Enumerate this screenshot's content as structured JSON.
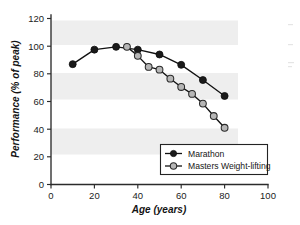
{
  "chart_data": {
    "type": "line",
    "title": "",
    "xlabel": "Age (years)",
    "ylabel": "Performance (% of peak)",
    "xlim": [
      0,
      100
    ],
    "ylim": [
      0,
      120
    ],
    "xticks": [
      0,
      20,
      40,
      60,
      80,
      100
    ],
    "yticks": [
      0,
      20,
      40,
      60,
      80,
      100,
      120
    ],
    "grid": "alternating horizontal gray bands",
    "legend_position": "lower-right inside axes",
    "series": [
      {
        "name": "Marathon",
        "marker": "filled-circle",
        "color": "#1a1a1a",
        "x": [
          10,
          20,
          30,
          40,
          50,
          60,
          70,
          80
        ],
        "values": [
          87,
          97.5,
          99.5,
          97.5,
          94,
          86.5,
          75.5,
          64
        ]
      },
      {
        "name": "Masters Weight-lifting",
        "marker": "open-circle",
        "color": "#b6b6b6",
        "x": [
          35,
          40,
          45,
          50,
          55,
          60,
          65,
          70,
          75,
          80
        ],
        "values": [
          99.5,
          93,
          85,
          83,
          76.5,
          70.5,
          65.5,
          58.5,
          49.5,
          41
        ]
      }
    ]
  },
  "axes": {
    "x_title": "Age (years)",
    "y_title": "Performance (% of peak)",
    "x_tick_labels": [
      "0",
      "20",
      "40",
      "60",
      "80",
      "100"
    ],
    "y_tick_labels": [
      "0",
      "20",
      "40",
      "60",
      "80",
      "100",
      "120"
    ]
  },
  "legend": {
    "entries": [
      {
        "label": "Marathon",
        "marker": "filled-circle"
      },
      {
        "label": "Masters Weight-lifting",
        "marker": "open-circle"
      }
    ]
  },
  "colors": {
    "marathon": "#1a1a1a",
    "weightlifting": "#b6b6b6",
    "band": "#eeeeee",
    "axis": "#2b2b2b",
    "background": "#ffffff"
  }
}
